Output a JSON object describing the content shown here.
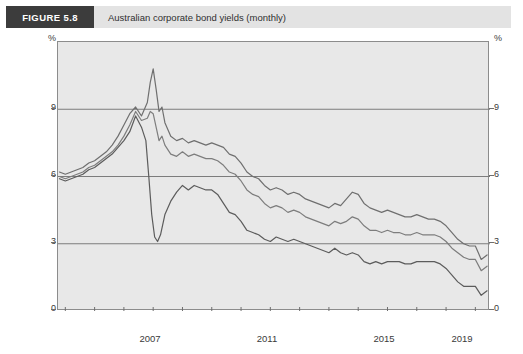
{
  "header": {
    "figure_tag": "FIGURE 5.8",
    "caption": "Australian corporate bond yields (monthly)"
  },
  "axes": {
    "y_unit_left": "%",
    "y_unit_right": "%",
    "y_ticks": [
      "9",
      "6",
      "3",
      "0"
    ],
    "y_ticks_right": [
      "9",
      "6",
      "3",
      "0"
    ],
    "x_ticks": [
      "2007",
      "2011",
      "2015",
      "2019"
    ]
  },
  "annotations": {
    "bbb": "BBB",
    "a": "A",
    "swap": "Swap"
  },
  "colors": {
    "plot_background": "#e8e8e8",
    "frame": "#8c8c8c",
    "gridline": "#7c7c7c",
    "series_bbb": "#6f6f6f",
    "series_a": "#7d7d7d",
    "series_swap": "#5c5c5c",
    "header_tag_background": "#3c3c3c",
    "header_background": "#e3e3e3"
  },
  "chart_data": {
    "type": "line",
    "title": "Australian corporate bond yields (monthly)",
    "xlabel": "",
    "ylabel": "%",
    "xlim": [
      2005.75,
      2020.5
    ],
    "ylim": [
      0,
      12
    ],
    "ytick_values": [
      0,
      3,
      6,
      9
    ],
    "xtick_values": [
      2007,
      2011,
      2015,
      2019
    ],
    "grid": "horizontal",
    "legend": "inline-annotations",
    "series": [
      {
        "name": "BBB",
        "color": "#6f6f6f",
        "x": [
          2005.8,
          2006.0,
          2006.2,
          2006.4,
          2006.6,
          2006.8,
          2007.0,
          2007.2,
          2007.4,
          2007.6,
          2007.8,
          2008.0,
          2008.2,
          2008.4,
          2008.6,
          2008.8,
          2008.9,
          2009.0,
          2009.1,
          2009.2,
          2009.3,
          2009.4,
          2009.6,
          2009.8,
          2010.0,
          2010.2,
          2010.4,
          2010.6,
          2010.8,
          2011.0,
          2011.2,
          2011.4,
          2011.6,
          2011.8,
          2012.0,
          2012.2,
          2012.4,
          2012.6,
          2012.8,
          2013.0,
          2013.2,
          2013.4,
          2013.6,
          2013.8,
          2014.0,
          2014.2,
          2014.4,
          2014.6,
          2014.8,
          2015.0,
          2015.2,
          2015.4,
          2015.6,
          2015.8,
          2016.0,
          2016.2,
          2016.4,
          2016.6,
          2016.8,
          2017.0,
          2017.2,
          2017.4,
          2017.6,
          2017.8,
          2018.0,
          2018.2,
          2018.4,
          2018.6,
          2018.8,
          2019.0,
          2019.2,
          2019.4,
          2019.6,
          2019.8,
          2020.0,
          2020.2,
          2020.4
        ],
        "values": [
          6.2,
          6.1,
          6.2,
          6.3,
          6.4,
          6.6,
          6.7,
          6.9,
          7.1,
          7.4,
          7.8,
          8.3,
          8.8,
          9.1,
          8.7,
          9.3,
          10.2,
          10.8,
          9.9,
          8.9,
          9.1,
          8.4,
          7.8,
          7.6,
          7.7,
          7.5,
          7.6,
          7.5,
          7.4,
          7.5,
          7.4,
          7.3,
          7.0,
          6.9,
          6.6,
          6.2,
          6.0,
          5.9,
          5.6,
          5.4,
          5.5,
          5.4,
          5.2,
          5.3,
          5.2,
          5.0,
          4.9,
          4.8,
          4.7,
          4.6,
          4.8,
          4.7,
          5.0,
          5.3,
          5.2,
          4.8,
          4.6,
          4.5,
          4.4,
          4.5,
          4.4,
          4.3,
          4.2,
          4.2,
          4.3,
          4.2,
          4.1,
          4.1,
          4.0,
          3.8,
          3.5,
          3.2,
          3.0,
          2.9,
          2.9,
          2.3,
          2.5
        ]
      },
      {
        "name": "A",
        "color": "#7d7d7d",
        "x": [
          2005.8,
          2006.0,
          2006.2,
          2006.4,
          2006.6,
          2006.8,
          2007.0,
          2007.2,
          2007.4,
          2007.6,
          2007.8,
          2008.0,
          2008.2,
          2008.4,
          2008.6,
          2008.8,
          2008.9,
          2009.0,
          2009.1,
          2009.2,
          2009.3,
          2009.4,
          2009.6,
          2009.8,
          2010.0,
          2010.2,
          2010.4,
          2010.6,
          2010.8,
          2011.0,
          2011.2,
          2011.4,
          2011.6,
          2011.8,
          2012.0,
          2012.2,
          2012.4,
          2012.6,
          2012.8,
          2013.0,
          2013.2,
          2013.4,
          2013.6,
          2013.8,
          2014.0,
          2014.2,
          2014.4,
          2014.6,
          2014.8,
          2015.0,
          2015.2,
          2015.4,
          2015.6,
          2015.8,
          2016.0,
          2016.2,
          2016.4,
          2016.6,
          2016.8,
          2017.0,
          2017.2,
          2017.4,
          2017.6,
          2017.8,
          2018.0,
          2018.2,
          2018.4,
          2018.6,
          2018.8,
          2019.0,
          2019.2,
          2019.4,
          2019.6,
          2019.8,
          2020.0,
          2020.2,
          2020.4
        ],
        "values": [
          6.0,
          5.9,
          6.0,
          6.1,
          6.2,
          6.4,
          6.5,
          6.7,
          6.9,
          7.1,
          7.4,
          7.8,
          8.3,
          8.9,
          8.5,
          8.6,
          8.9,
          8.8,
          8.2,
          7.6,
          7.8,
          7.4,
          7.0,
          6.9,
          7.1,
          6.9,
          7.0,
          6.9,
          6.8,
          6.8,
          6.7,
          6.5,
          6.2,
          6.1,
          5.8,
          5.4,
          5.2,
          5.1,
          4.8,
          4.6,
          4.7,
          4.6,
          4.4,
          4.5,
          4.4,
          4.2,
          4.1,
          4.0,
          3.9,
          3.8,
          4.0,
          3.9,
          4.0,
          4.2,
          4.1,
          3.8,
          3.6,
          3.6,
          3.5,
          3.6,
          3.5,
          3.5,
          3.4,
          3.4,
          3.5,
          3.4,
          3.4,
          3.4,
          3.3,
          3.1,
          2.8,
          2.6,
          2.4,
          2.3,
          2.3,
          1.8,
          2.0
        ]
      },
      {
        "name": "Swap",
        "color": "#5c5c5c",
        "x": [
          2005.8,
          2006.0,
          2006.2,
          2006.4,
          2006.6,
          2006.8,
          2007.0,
          2007.2,
          2007.4,
          2007.6,
          2007.8,
          2008.0,
          2008.2,
          2008.4,
          2008.6,
          2008.75,
          2008.85,
          2008.95,
          2009.05,
          2009.15,
          2009.25,
          2009.4,
          2009.6,
          2009.8,
          2010.0,
          2010.2,
          2010.4,
          2010.6,
          2010.8,
          2011.0,
          2011.2,
          2011.4,
          2011.6,
          2011.8,
          2012.0,
          2012.2,
          2012.4,
          2012.6,
          2012.8,
          2013.0,
          2013.2,
          2013.4,
          2013.6,
          2013.8,
          2014.0,
          2014.2,
          2014.4,
          2014.6,
          2014.8,
          2015.0,
          2015.2,
          2015.4,
          2015.6,
          2015.8,
          2016.0,
          2016.2,
          2016.4,
          2016.6,
          2016.8,
          2017.0,
          2017.2,
          2017.4,
          2017.6,
          2017.8,
          2018.0,
          2018.2,
          2018.4,
          2018.6,
          2018.8,
          2019.0,
          2019.2,
          2019.4,
          2019.6,
          2019.8,
          2020.0,
          2020.2,
          2020.4
        ],
        "values": [
          5.9,
          5.8,
          5.9,
          6.0,
          6.1,
          6.3,
          6.4,
          6.6,
          6.8,
          7.0,
          7.3,
          7.6,
          8.0,
          8.7,
          8.2,
          7.6,
          6.0,
          4.3,
          3.3,
          3.1,
          3.4,
          4.3,
          4.9,
          5.3,
          5.6,
          5.4,
          5.6,
          5.5,
          5.4,
          5.4,
          5.2,
          4.8,
          4.4,
          4.3,
          4.0,
          3.6,
          3.5,
          3.4,
          3.2,
          3.1,
          3.3,
          3.2,
          3.1,
          3.2,
          3.1,
          3.0,
          2.9,
          2.8,
          2.7,
          2.6,
          2.8,
          2.6,
          2.5,
          2.6,
          2.5,
          2.2,
          2.1,
          2.2,
          2.1,
          2.2,
          2.2,
          2.2,
          2.1,
          2.1,
          2.2,
          2.2,
          2.2,
          2.2,
          2.1,
          1.9,
          1.6,
          1.3,
          1.1,
          1.1,
          1.1,
          0.7,
          0.9
        ]
      }
    ]
  }
}
